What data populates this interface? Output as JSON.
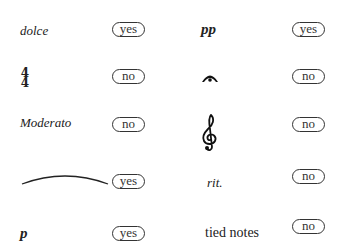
{
  "items": [
    {
      "label": "dolce",
      "answer": "yes"
    },
    {
      "label": "4/4",
      "numerator": "4",
      "denominator": "4",
      "answer": "no"
    },
    {
      "label": "Moderato",
      "answer": "no"
    },
    {
      "label": "slur",
      "answer": "yes"
    },
    {
      "label": "p",
      "answer": "yes"
    },
    {
      "label": "pp",
      "answer": "yes"
    },
    {
      "label": "fermata",
      "answer": "no"
    },
    {
      "label": "treble clef",
      "answer": "no"
    },
    {
      "label": "rit.",
      "answer": "no"
    },
    {
      "label": "tied notes",
      "answer": "no"
    }
  ]
}
